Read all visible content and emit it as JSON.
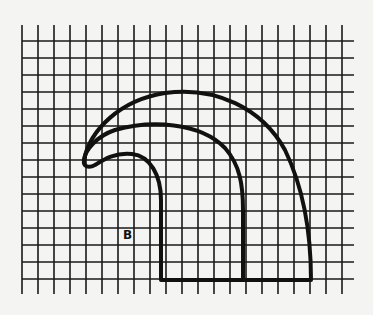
{
  "figure": {
    "type": "grid-drawing",
    "background_color": "#f4f4f2",
    "line_color": "#1a1a1a",
    "grid": {
      "columns": 20,
      "rows": 14,
      "vertical_line_count": 21,
      "horizontal_line_count": 15
    },
    "shape": {
      "description": "curled hook / wave shape drawn on graph paper",
      "label": "B"
    }
  }
}
